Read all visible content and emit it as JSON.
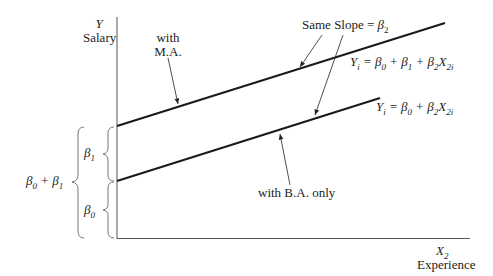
{
  "y_axis": {
    "symbol": "Y",
    "label": "Salary"
  },
  "x_axis": {
    "symbol": "X",
    "subscript": "2",
    "label": "Experience"
  },
  "lines": [
    {
      "name": "with M.A.",
      "label_line1": "with",
      "label_line2": "M.A.",
      "equation": "Yi = β0 + β1 + β2X2i"
    },
    {
      "name": "with B.A. only",
      "label": "with B.A. only",
      "equation": "Yi = β0 + β2X2i"
    }
  ],
  "slope_note": "Same Slope = β2",
  "brackets": {
    "beta1": "β1",
    "beta0": "β0",
    "sum": "β0 + β1"
  },
  "colors": {
    "line": "#1a1a1a",
    "axis": "#555555",
    "bracket": "#777777"
  }
}
